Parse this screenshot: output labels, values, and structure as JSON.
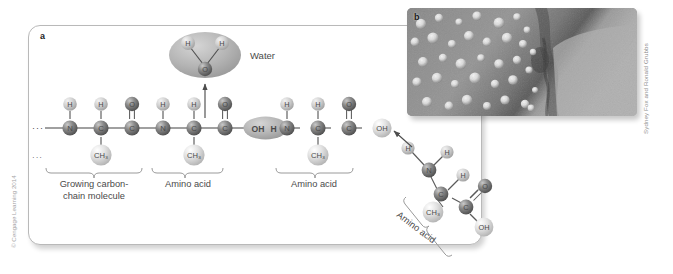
{
  "figure": {
    "panel_a_label": "a",
    "panel_b_label": "b",
    "credit": "Sydney Fox and Ronald Grubbs",
    "copyright": "© Cengage Learning 2014"
  },
  "labels": {
    "water": "Water",
    "growing_chain_line1": "Growing carbon-",
    "growing_chain_line2": "chain molecule",
    "amino_acid_1": "Amino acid",
    "amino_acid_2": "Amino acid",
    "amino_acid_incoming": "Amino acid"
  },
  "atoms": {
    "hydrogen": "H",
    "nitrogen": "N",
    "carbon": "C",
    "oxygen": "O",
    "methyl": "CH₃",
    "hydroxyl": "OH",
    "ellipsis": "···"
  },
  "reaction_site": {
    "left": "OH",
    "right": "H"
  },
  "water_molecule": {
    "h_left": "H",
    "h_right": "H",
    "oxygen": "O"
  },
  "incoming_amino_acid": {
    "h_top_left": "H",
    "h_top_right": "H",
    "nitrogen": "N",
    "h_side": "H",
    "alpha_carbon": "C",
    "methyl": "CH₃",
    "carboxyl_carbon": "C",
    "oxygen_double": "O",
    "hydroxyl": "OH"
  },
  "colors": {
    "panel_border": "#b9b9b9",
    "bond": "#555555",
    "atom_dark": "#6e6e6e",
    "atom_light": "#d8d8d8",
    "label_text": "#4a4a4a",
    "highlight_ellipse": "#b5b5b5"
  }
}
